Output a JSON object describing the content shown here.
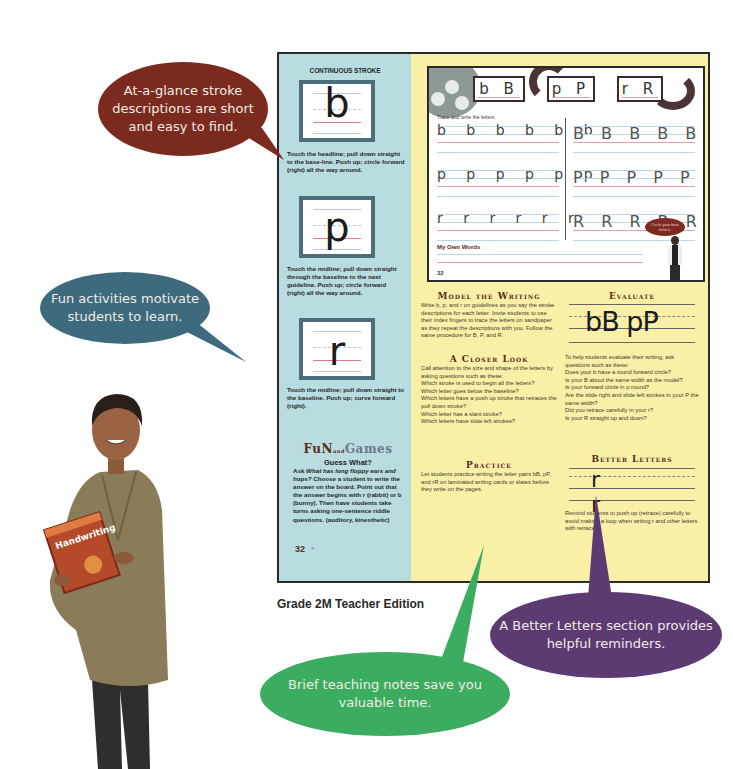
{
  "callouts": {
    "stroke": "At-a-glance stroke descriptions are short and easy to find.",
    "fun": "Fun activities motivate students to learn.",
    "better": "A Better Letters section provides helpful reminders.",
    "notes": "Brief teaching notes save you valuable time.",
    "colors": {
      "brown": "#7a2a1e",
      "blue": "#3d6a7c",
      "purple": "#5c3a72",
      "green": "#3cac60"
    }
  },
  "caption": "Grade 2M Teacher Edition",
  "sidebar": {
    "title": "CONTINUOUS STROKE",
    "strokes": [
      {
        "letter": "b",
        "description": "Touch the headline; pull down straight to the base-line. Push up; circle forward (right) all the way around."
      },
      {
        "letter": "p",
        "description": "Touch the midline; pull down straight through the baseline to the next guideline. Push up; circle forward (right) all the way around."
      },
      {
        "letter": "r",
        "description": "Touch the midline; pull down straight to the baseline. Push up; curve forward (right)."
      }
    ],
    "fun_and_games": {
      "fun": "FuN",
      "and": "and",
      "games": "Games"
    },
    "guess_title": "Guess What?",
    "guess_lead": "Ask ",
    "guess_question": "What has long floppy ears and hops?",
    "guess_body": " Choose a student to write the answer on the board. Point out that the answer begins with r (rabbit) or b (bunny). Then have students take turns asking one-sentence riddle questions. (auditory, kinesthetic)",
    "page_number": "32"
  },
  "workbook": {
    "pairs": [
      "b B",
      "p P",
      "r R"
    ],
    "instruction": "Trace and write the letters.",
    "rows_lower": [
      "b b b b b b",
      "p p p p p p",
      "r r r r r r"
    ],
    "rows_upper": [
      "B B B B B",
      "P P P P P",
      "R R R R R"
    ],
    "own_words": "My Own Words",
    "bubble": "Circle your best letters.",
    "page_number": "32"
  },
  "model_writing": {
    "title": "Model the Writing",
    "body": "Write b, p, and r on guidelines as you say the stroke descriptions for each letter. Invite students to use their index fingers to trace the letters on sandpaper as they repeat the descriptions with you. Follow the same procedure for B, P, and R."
  },
  "closer_look": {
    "title": "A Closer Look",
    "intro": "Call attention to the size and shape of the letters by asking questions such as these:",
    "questions": [
      "Which stroke is used to begin all the letters?",
      "Which letter goes below the baseline?",
      "Which letters have a push up stroke that retraces the pull down stroke?",
      "Which letter has a slant stroke?",
      "Which letters have slide left strokes?"
    ]
  },
  "practice": {
    "title": "Practice",
    "body": "Let students practice writing the letter pairs bB, pP, and rR on laminated writing cards or slates before they write on the pages."
  },
  "evaluate": {
    "title": "Evaluate",
    "sample": "bB pP",
    "intro": "To help students evaluate their writing, ask questions such as these:",
    "questions": [
      "Does your b have a round forward circle?",
      "Is your B about the same width as the model?",
      "Is your forward circle in p round?",
      "Are the slide right and slide left strokes in your P the same width?",
      "Did you retrace carefully in your r?",
      "Is your R straight up and down?"
    ]
  },
  "better_letters": {
    "title": "Better Letters",
    "sample": "r r",
    "body": "Remind students to push up (retrace) carefully to avoid making a loop when writing r and other letters with retraces."
  }
}
